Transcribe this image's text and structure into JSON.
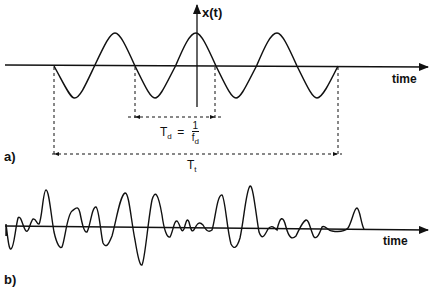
{
  "figure": {
    "panel_a": {
      "label": "a)",
      "y_axis_label": "x(t)",
      "x_axis_label": "time",
      "period_label": {
        "symbol": "T",
        "subscript": "d",
        "equals": "=",
        "numerator": "1",
        "denominator_symbol": "f",
        "denominator_subscript": "d"
      },
      "total_label": {
        "symbol": "T",
        "subscript": "t"
      },
      "signal": "sinusoid",
      "cycles": 3.5
    },
    "panel_b": {
      "label": "b)",
      "x_axis_label": "time",
      "signal": "random"
    },
    "colors": {
      "line": "#111111",
      "background": "#ffffff"
    }
  }
}
